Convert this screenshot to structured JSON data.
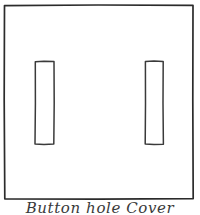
{
  "drawing": {
    "title": "hand-drawn-sketch",
    "background_color": "#ffffff",
    "stroke_color": "#2b2b2b",
    "slot_stroke_color": "#3a3a3a",
    "outer_frame": {
      "name": "cover-plate-outline",
      "x": 4,
      "y": 5,
      "width": 189,
      "height": 194
    },
    "slots": [
      {
        "name": "left-slot",
        "x": 35,
        "y": 61,
        "width": 19,
        "height": 83
      },
      {
        "name": "right-slot",
        "x": 145,
        "y": 61,
        "width": 18,
        "height": 83
      }
    ]
  },
  "caption": {
    "text": "Button hole Cover"
  }
}
